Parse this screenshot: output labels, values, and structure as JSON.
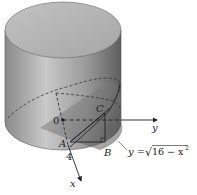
{
  "figure": {
    "labels": {
      "origin": "0",
      "x_axis": "x",
      "y_axis": "y",
      "point_a": "A",
      "point_b": "B",
      "point_c": "C",
      "radius": "4"
    },
    "equation": {
      "lhs": "y =",
      "radical": "√",
      "radicand": "16 − x",
      "exponent": "2"
    },
    "colors": {
      "cylinder_light": "#c8c8c8",
      "cylinder_dark": "#6f6f6f",
      "top_face": "#b4b4b4",
      "lines": "#222222"
    }
  }
}
